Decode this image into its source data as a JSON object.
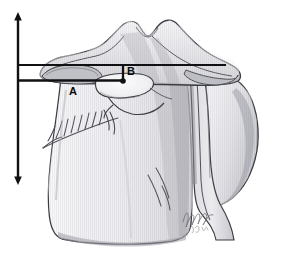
{
  "figure": {
    "background_color": "#ffffff"
  },
  "measurements": [
    {
      "id": "A",
      "label": "A",
      "type": "horizontal-distance",
      "label_x": 73,
      "label_y": 91,
      "line_x1": 19,
      "line_x2": 124,
      "line_y": 80
    },
    {
      "id": "B",
      "label": "B",
      "type": "vertical-distance",
      "label_x": 127,
      "label_y": 74,
      "line_x": 123,
      "line_y1": 64,
      "line_y2": 82
    }
  ],
  "reference_axis": {
    "name": "vertical-reference-axis",
    "orientation": "vertical",
    "x": 18,
    "y_top": 14,
    "y_bottom": 182,
    "arrowheads": "both"
  },
  "upper_reference_line": {
    "name": "upper-horizontal-reference-line",
    "x1": 18,
    "x2": 226,
    "y": 65
  },
  "signature": {
    "primary": "Raja",
    "secondary": "2014",
    "x": 183,
    "y": 221
  },
  "colors": {
    "line": "#111114",
    "bone_outline": "#3d3d42",
    "bone_light": "#e9e9ec",
    "bone_mid": "#d2d2d6",
    "bone_dark": "#b4b4ba",
    "bone_shadow": "#9a9aa1",
    "cartilage": "#c4c4ca",
    "background": "#ffffff",
    "signature": "#6e6e72"
  },
  "anatomy_parts": [
    {
      "name": "superior-tubercles",
      "label": ""
    },
    {
      "name": "superior-articular-surface",
      "label": ""
    },
    {
      "name": "medial-condyle",
      "label": ""
    },
    {
      "name": "lateral-condyle",
      "label": ""
    },
    {
      "name": "fossa-depression",
      "label": ""
    },
    {
      "name": "fracture-lines-medial",
      "label": ""
    },
    {
      "name": "fracture-lines-central",
      "label": ""
    },
    {
      "name": "shaft",
      "label": ""
    }
  ]
}
